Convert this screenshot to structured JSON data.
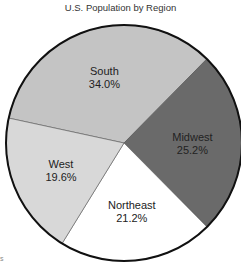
{
  "chart_data": {
    "type": "pie",
    "title": "U.S. Population by Region",
    "categories": [
      "South",
      "Midwest",
      "Northeast",
      "West"
    ],
    "values": [
      34.0,
      25.2,
      21.2,
      19.6
    ],
    "labels": [
      "34.0%",
      "25.2%",
      "21.2%",
      "19.6%"
    ],
    "colors": [
      "#c4c4c4",
      "#6a6a6a",
      "#ffffff",
      "#d8d8d8"
    ],
    "start_angle_deg": -77.8,
    "direction": "clockwise",
    "legend": "none (labels inside slices)"
  },
  "footnote": "s"
}
